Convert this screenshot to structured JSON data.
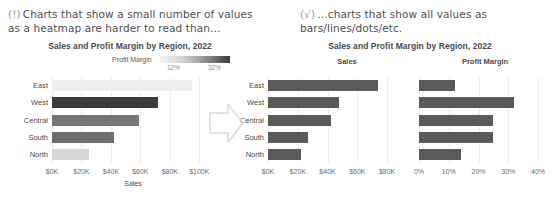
{
  "annotations": {
    "left": {
      "mark": "(!)",
      "text": "Charts that show a small number of values as a heatmap are harder to read than…"
    },
    "right": {
      "mark": "(√)",
      "text": "…charts that show all values as bars/lines/dots/etc."
    },
    "arrow_icon": "arrow-right-outline"
  },
  "left_panel": {
    "title": "Sales and Profit Margin by Region, 2022",
    "legend": {
      "label": "Profit Margin",
      "low": "12%",
      "high": "32%",
      "low_color": "#f2f2f2",
      "high_color": "#3a3a3a"
    }
  },
  "right_panel": {
    "title": "Sales and Profit Margin by Region, 2022",
    "sub_titles": [
      "Sales",
      "Profit Margin"
    ],
    "bar_color": "#5a5a5a"
  },
  "chart_data": [
    {
      "type": "bar",
      "id": "heatmap-bar-chart",
      "title": "Sales and Profit Margin by Region, 2022",
      "orientation": "horizontal",
      "categories": [
        "East",
        "West",
        "Central",
        "South",
        "North"
      ],
      "values": [
        95,
        72,
        59,
        42,
        25
      ],
      "value_unit": "$K",
      "color_encoding": {
        "field": "Profit Margin",
        "values": [
          12,
          32,
          25,
          25,
          14
        ],
        "unit": "%",
        "colors": [
          "#efefef",
          "#3b3b3b",
          "#767676",
          "#6e6e6e",
          "#d7d7d7"
        ],
        "legend_low": "12%",
        "legend_high": "32%"
      },
      "xlabel": "Sales",
      "ylabel": "",
      "xlim": [
        0,
        110
      ],
      "xticks": [
        "$0K",
        "$20K",
        "$40K",
        "$60K",
        "$80K",
        "$100K"
      ],
      "xtick_values": [
        0,
        20,
        40,
        60,
        80,
        100
      ],
      "grid": true,
      "legend_position": "top"
    },
    {
      "type": "bar",
      "id": "sales-bar-chart",
      "title": "Sales",
      "orientation": "horizontal",
      "categories": [
        "East",
        "West",
        "Central",
        "South",
        "North"
      ],
      "values": [
        74,
        48,
        42,
        27,
        22
      ],
      "value_unit": "$K",
      "color": "#5a5a5a",
      "xlabel": "",
      "ylabel": "",
      "xlim": [
        0,
        88
      ],
      "xticks": [
        "$0K",
        "$20K",
        "$40K",
        "$60K",
        "$80K"
      ],
      "xtick_values": [
        0,
        20,
        40,
        60,
        80
      ],
      "grid": true,
      "legend_position": "none"
    },
    {
      "type": "bar",
      "id": "profit-margin-bar-chart",
      "title": "Profit Margin",
      "orientation": "horizontal",
      "categories": [
        "East",
        "West",
        "Central",
        "South",
        "North"
      ],
      "values": [
        12,
        32,
        25,
        25,
        14
      ],
      "value_unit": "%",
      "color": "#5a5a5a",
      "xlabel": "",
      "ylabel": "",
      "xlim": [
        0,
        44
      ],
      "xticks": [
        "0%",
        "10%",
        "20%",
        "30%",
        "40%"
      ],
      "xtick_values": [
        0,
        10,
        20,
        30,
        40
      ],
      "grid": true,
      "legend_position": "none"
    }
  ]
}
